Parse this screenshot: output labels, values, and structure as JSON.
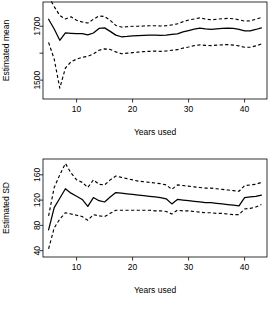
{
  "figure": {
    "background": "#ffffff",
    "ink_color": "#000000",
    "panel_count": 2
  },
  "chart_data": [
    {
      "type": "line",
      "title": "",
      "subtitle": "",
      "panel_name": "estimated-mean",
      "xlabel": "Years used",
      "ylabel": "Estimated mean",
      "xlim": [
        4.0,
        44.0
      ],
      "ylim": [
        1430,
        1790
      ],
      "xticks": [
        10,
        20,
        30,
        40
      ],
      "xticklabels": [
        "10",
        "20",
        "30",
        "40"
      ],
      "yticks": [
        1500,
        1600,
        1700,
        1800
      ],
      "yticklabels": [
        "1500",
        "",
        "1700",
        ""
      ],
      "ytick_labeled": [
        1500,
        1700
      ],
      "grid": false,
      "legend": "none",
      "x": [
        5,
        6,
        7,
        8,
        9,
        10,
        11,
        12,
        13,
        14,
        15,
        16,
        17,
        18,
        19,
        20,
        21,
        22,
        23,
        24,
        25,
        26,
        27,
        28,
        29,
        30,
        31,
        32,
        33,
        34,
        35,
        36,
        37,
        38,
        39,
        40,
        41,
        42,
        43
      ],
      "series": [
        {
          "name": "Estimated mean",
          "style": "solid",
          "values": [
            1726,
            1690,
            1648,
            1675,
            1674,
            1673,
            1673,
            1668,
            1675,
            1692,
            1694,
            1681,
            1667,
            1661,
            1662,
            1664,
            1665,
            1666,
            1667,
            1667,
            1666,
            1667,
            1670,
            1672,
            1679,
            1684,
            1689,
            1693,
            1690,
            1688,
            1690,
            1692,
            1693,
            1692,
            1688,
            1683,
            1683,
            1688,
            1694
          ]
        },
        {
          "name": "Upper confidence band",
          "style": "dashed",
          "values": [
            1810,
            1773,
            1740,
            1727,
            1735,
            1722,
            1716,
            1712,
            1726,
            1738,
            1736,
            1722,
            1703,
            1697,
            1698,
            1700,
            1700,
            1701,
            1702,
            1702,
            1701,
            1702,
            1705,
            1709,
            1717,
            1723,
            1727,
            1731,
            1727,
            1724,
            1726,
            1728,
            1729,
            1728,
            1724,
            1719,
            1720,
            1726,
            1733
          ]
        },
        {
          "name": "Lower confidence band",
          "style": "dashed",
          "values": [
            1640,
            1578,
            1470,
            1545,
            1568,
            1578,
            1585,
            1588,
            1597,
            1611,
            1616,
            1614,
            1605,
            1598,
            1600,
            1602,
            1604,
            1606,
            1607,
            1608,
            1607,
            1608,
            1611,
            1613,
            1619,
            1623,
            1628,
            1631,
            1629,
            1628,
            1630,
            1631,
            1632,
            1630,
            1627,
            1622,
            1622,
            1627,
            1634
          ]
        }
      ]
    },
    {
      "type": "line",
      "title": "",
      "subtitle": "",
      "panel_name": "estimated-sd",
      "xlabel": "Years used",
      "ylabel": "Estimated SD",
      "xlim": [
        4.0,
        44.0
      ],
      "ylim": [
        30,
        185
      ],
      "xticks": [
        10,
        20,
        30,
        40
      ],
      "xticklabels": [
        "10",
        "20",
        "30",
        "40"
      ],
      "yticks": [
        40,
        80,
        120,
        160
      ],
      "yticklabels": [
        "40",
        "80",
        "120",
        "160"
      ],
      "ytick_labeled": [
        40,
        80,
        120,
        160
      ],
      "grid": false,
      "legend": "none",
      "x": [
        5,
        6,
        7,
        8,
        9,
        10,
        11,
        12,
        13,
        14,
        15,
        16,
        17,
        18,
        19,
        20,
        21,
        22,
        23,
        24,
        25,
        26,
        27,
        28,
        29,
        30,
        31,
        32,
        33,
        34,
        35,
        36,
        37,
        38,
        39,
        40,
        41,
        42,
        43
      ],
      "series": [
        {
          "name": "Estimated SD",
          "style": "solid",
          "values": [
            73,
            108,
            123,
            138,
            131,
            126,
            121,
            110,
            124,
            119,
            117,
            125,
            132,
            131,
            130,
            129,
            128,
            127,
            126,
            125,
            124,
            122,
            114,
            121,
            120,
            119,
            118,
            117,
            116,
            116,
            115,
            114,
            113,
            112,
            111,
            124,
            125,
            126,
            128
          ]
        },
        {
          "name": "Upper confidence band",
          "style": "dashed",
          "values": [
            95,
            140,
            160,
            178,
            163,
            152,
            148,
            140,
            152,
            145,
            144,
            152,
            158,
            156,
            154,
            152,
            150,
            149,
            148,
            147,
            146,
            144,
            137,
            144,
            143,
            142,
            141,
            140,
            139,
            139,
            138,
            137,
            136,
            135,
            134,
            143,
            144,
            145,
            148
          ]
        },
        {
          "name": "Lower confidence band",
          "style": "dashed",
          "values": [
            43,
            76,
            90,
            100,
            98,
            96,
            94,
            88,
            97,
            95,
            94,
            99,
            104,
            104,
            104,
            104,
            104,
            104,
            104,
            103,
            103,
            102,
            98,
            104,
            103,
            103,
            102,
            101,
            100,
            100,
            99,
            99,
            98,
            97,
            97,
            106,
            107,
            109,
            113
          ]
        }
      ]
    }
  ]
}
